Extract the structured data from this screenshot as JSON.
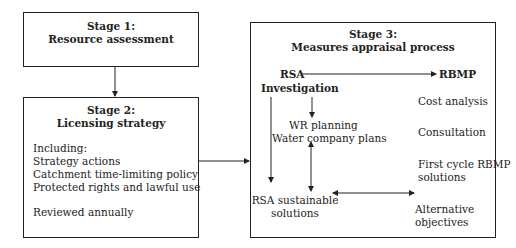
{
  "stage1": {
    "title": "Stage 1:",
    "subtitle": "Resource assessment"
  },
  "stage2": {
    "title": "Stage 2:",
    "subtitle": "Licensing strategy",
    "including_label": "Including:",
    "items": [
      "Strategy actions",
      "Catchment time-limiting policy",
      "Protected rights and lawful use"
    ],
    "note": "Reviewed annually"
  },
  "stage3": {
    "title": "Stage 3:",
    "subtitle": "Measures appraisal process",
    "nodes": {
      "rsa": "RSA",
      "investigation": "Investigation",
      "rbmp": "RBMP",
      "wr_planning": "WR planning",
      "water_company_plans": "Water company plans",
      "rsa_sustainable_1": "RSA sustainable",
      "rsa_sustainable_2": "solutions",
      "cost_analysis": "Cost analysis",
      "consultation": "Consultation",
      "first_cycle_1": "First cycle RBMP",
      "first_cycle_2": "solutions",
      "alternative_1": "Alternative",
      "alternative_2": "objectives"
    }
  }
}
